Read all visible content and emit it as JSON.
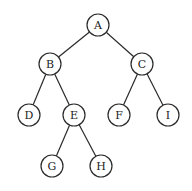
{
  "diagram": {
    "type": "binary-tree",
    "node_radius": 11,
    "colors": {
      "stroke": "#2a2a2a",
      "fill": "#ffffff",
      "text": "#222222"
    },
    "nodes": [
      {
        "id": "A",
        "label": "A",
        "x": 98,
        "y": 25
      },
      {
        "id": "B",
        "label": "B",
        "x": 50,
        "y": 64
      },
      {
        "id": "C",
        "label": "C",
        "x": 142,
        "y": 64
      },
      {
        "id": "D",
        "label": "D",
        "x": 29,
        "y": 115
      },
      {
        "id": "E",
        "label": "E",
        "x": 74,
        "y": 115
      },
      {
        "id": "F",
        "label": "F",
        "x": 119,
        "y": 115
      },
      {
        "id": "I",
        "label": "I",
        "x": 168,
        "y": 115
      },
      {
        "id": "G",
        "label": "G",
        "x": 52,
        "y": 166
      },
      {
        "id": "H",
        "label": "H",
        "x": 101,
        "y": 166
      }
    ],
    "edges": [
      [
        "A",
        "B"
      ],
      [
        "A",
        "C"
      ],
      [
        "B",
        "D"
      ],
      [
        "B",
        "E"
      ],
      [
        "C",
        "F"
      ],
      [
        "C",
        "I"
      ],
      [
        "E",
        "G"
      ],
      [
        "E",
        "H"
      ]
    ]
  }
}
